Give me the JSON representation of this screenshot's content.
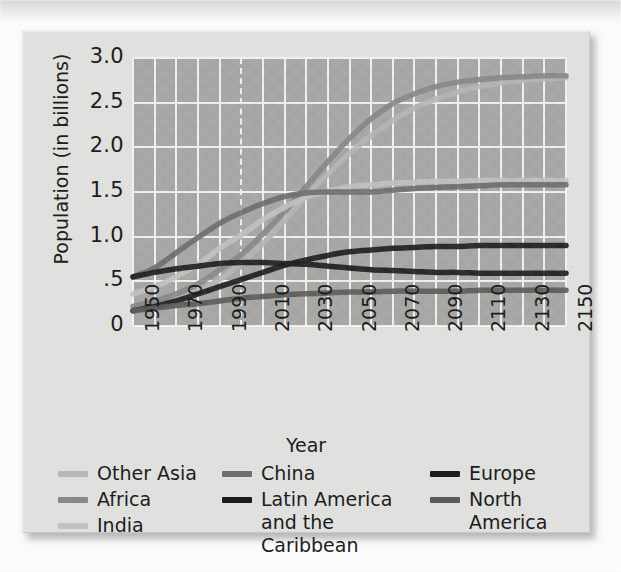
{
  "chart_data": {
    "type": "line",
    "title": "",
    "subtitle": "",
    "xlabel": "Year",
    "ylabel": "Population (in billions)",
    "xlim": [
      1950,
      2150
    ],
    "ylim": [
      0,
      3.0
    ],
    "xticks": [
      "1950",
      "1970",
      "1990",
      "2010",
      "2030",
      "2050",
      "2070",
      "2090",
      "2110",
      "2130",
      "2150"
    ],
    "xtick_values": [
      1950,
      1970,
      1990,
      2010,
      2030,
      2050,
      2070,
      2090,
      2110,
      2130,
      2150
    ],
    "yticks": [
      "3.0",
      "2.5",
      "2.0",
      "1.5",
      "1.0",
      ".5",
      "0"
    ],
    "ytick_values": [
      3.0,
      2.5,
      2.0,
      1.5,
      1.0,
      0.5,
      0
    ],
    "grid": true,
    "grid_color": "#f4f4f2",
    "plot_background": "#a9a9a7",
    "legend_position": "below",
    "projection_divider_year": 2000,
    "projection_divider_style": "dashed",
    "x": [
      1950,
      1960,
      1970,
      1980,
      1990,
      2000,
      2010,
      2020,
      2030,
      2040,
      2050,
      2060,
      2070,
      2080,
      2090,
      2100,
      2110,
      2120,
      2130,
      2140,
      2150
    ],
    "series": [
      {
        "name": "Other Asia",
        "color": "#b9b9b7",
        "values": [
          0.17,
          0.22,
          0.29,
          0.39,
          0.52,
          0.7,
          0.92,
          1.18,
          1.45,
          1.7,
          1.93,
          2.13,
          2.3,
          2.44,
          2.54,
          2.62,
          2.68,
          2.72,
          2.75,
          2.77,
          2.78
        ]
      },
      {
        "name": "Africa",
        "color": "#8a8a88",
        "values": [
          0.22,
          0.28,
          0.36,
          0.47,
          0.63,
          0.8,
          1.03,
          1.28,
          1.56,
          1.84,
          2.1,
          2.32,
          2.49,
          2.6,
          2.68,
          2.73,
          2.76,
          2.78,
          2.79,
          2.8,
          2.8
        ]
      },
      {
        "name": "India",
        "color": "#c4c4c2",
        "values": [
          0.36,
          0.44,
          0.55,
          0.69,
          0.87,
          1.02,
          1.19,
          1.33,
          1.44,
          1.51,
          1.56,
          1.58,
          1.6,
          1.61,
          1.62,
          1.62,
          1.63,
          1.63,
          1.63,
          1.63,
          1.63
        ]
      },
      {
        "name": "China",
        "color": "#6f6f6d",
        "values": [
          0.55,
          0.65,
          0.82,
          0.99,
          1.15,
          1.27,
          1.37,
          1.45,
          1.49,
          1.5,
          1.5,
          1.5,
          1.52,
          1.54,
          1.55,
          1.56,
          1.57,
          1.58,
          1.58,
          1.58,
          1.58
        ]
      },
      {
        "name": "Europe",
        "color": "#1c1c1c",
        "values": [
          0.55,
          0.6,
          0.64,
          0.67,
          0.7,
          0.71,
          0.71,
          0.7,
          0.69,
          0.67,
          0.65,
          0.63,
          0.62,
          0.61,
          0.6,
          0.6,
          0.59,
          0.59,
          0.59,
          0.59,
          0.59
        ]
      },
      {
        "name": "Latin America and the Caribbean",
        "color": "#1c1c1c",
        "values": [
          0.17,
          0.22,
          0.28,
          0.36,
          0.44,
          0.52,
          0.6,
          0.68,
          0.74,
          0.79,
          0.83,
          0.85,
          0.87,
          0.88,
          0.89,
          0.89,
          0.9,
          0.9,
          0.9,
          0.9,
          0.9
        ]
      },
      {
        "name": "North America",
        "color": "#5c5c5a",
        "values": [
          0.17,
          0.2,
          0.23,
          0.25,
          0.28,
          0.31,
          0.33,
          0.35,
          0.36,
          0.37,
          0.38,
          0.38,
          0.39,
          0.39,
          0.39,
          0.39,
          0.4,
          0.4,
          0.4,
          0.4,
          0.4
        ]
      }
    ]
  },
  "axis": {
    "ylabel": "Population (in billions)",
    "xlabel": "Year"
  },
  "legend": {
    "columns": [
      {
        "items": [
          {
            "label": "Other Asia",
            "color": "#b9b9b7"
          },
          {
            "label": "Africa",
            "color": "#8a8a88"
          },
          {
            "label": "India",
            "color": "#c4c4c2"
          }
        ]
      },
      {
        "items": [
          {
            "label": "China",
            "color": "#6f6f6d"
          },
          {
            "label": "Latin America\nand the Caribbean",
            "color": "#1c1c1c"
          }
        ]
      },
      {
        "items": [
          {
            "label": "Europe",
            "color": "#1c1c1c"
          },
          {
            "label": "North\nAmerica",
            "color": "#5c5c5a"
          }
        ]
      }
    ]
  }
}
